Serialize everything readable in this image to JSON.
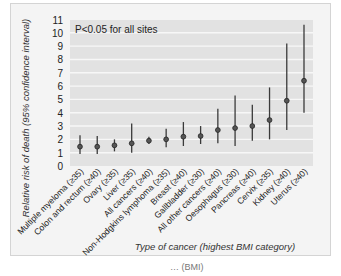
{
  "chart_data": {
    "type": "scatter",
    "subtype": "point-with-error-bars",
    "title": "",
    "annotation": "P<0.05 for all sites",
    "xlabel": "Type of cancer (highest BMI category)",
    "ylabel": "Relative risk of death (95% confidence interval)",
    "ylim": [
      0,
      11
    ],
    "yticks": [
      0,
      1,
      2,
      3,
      4,
      5,
      6,
      7,
      8,
      9,
      10,
      11
    ],
    "grid": true,
    "legend": null,
    "categories": [
      "Multiple myeloma (≥35)",
      "Colon and rectum (≥40)",
      "Ovary (≥35)",
      "Liver (≥35)",
      "All cancers (≥40)",
      "Non-Hodgkins lymphoma (≥35)",
      "Breast (≥40)",
      "Gallbladder (≥30)",
      "All other cancers (≥40)",
      "Oesophagus (≥30)",
      "Pancreas (≥40)",
      "Cervix (≥35)",
      "Kidney (≥40)",
      "Uterus (≥40)"
    ],
    "series": [
      {
        "name": "Relative risk",
        "values": [
          1.45,
          1.45,
          1.55,
          1.7,
          1.9,
          2.0,
          2.2,
          2.25,
          2.7,
          2.85,
          3.0,
          3.45,
          4.9,
          6.4
        ],
        "ci_low": [
          0.9,
          0.9,
          1.1,
          1.0,
          1.65,
          1.4,
          1.5,
          1.65,
          1.7,
          1.5,
          1.9,
          2.0,
          2.7,
          4.0
        ],
        "ci_high": [
          2.3,
          2.25,
          2.0,
          3.2,
          2.2,
          2.8,
          3.3,
          3.0,
          4.3,
          5.3,
          4.6,
          5.9,
          9.2,
          10.6
        ]
      }
    ]
  },
  "footer": {
    "caption_fragment": "… (BMI)"
  }
}
